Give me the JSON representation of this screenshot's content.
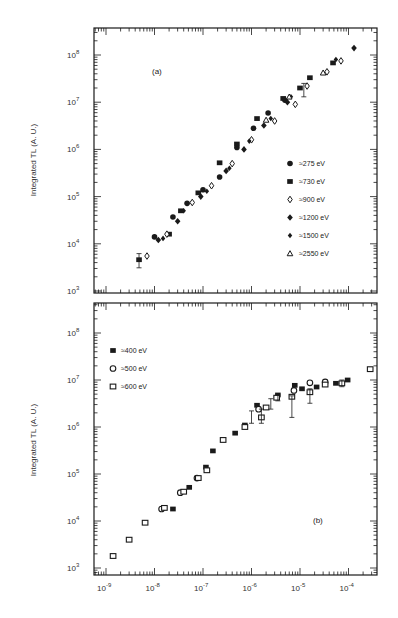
{
  "chart_data": [
    {
      "type": "scatter",
      "panel_label": "(a)",
      "title": "",
      "xlabel": "",
      "ylabel": "Integrated TL (A. U.)",
      "xscale": "log",
      "yscale": "log",
      "xlim": [
        6e-10,
        0.0004
      ],
      "ylim": [
        1000.0,
        300000000.0
      ],
      "x_tick_labels": [
        "10^-9",
        "10^-8",
        "10^-7",
        "10^-6",
        "10^-5",
        "10^-4"
      ],
      "y_tick_labels": [
        "10^3",
        "10^4",
        "10^5",
        "10^6",
        "10^7",
        "10^8"
      ],
      "grid": false,
      "legend_position": "center-right",
      "series": [
        {
          "name": "≈275 eV",
          "marker": "filled-circle",
          "points": [
            [
              1e-08,
              14000.0
            ],
            [
              2.4e-08,
              37000.0
            ],
            [
              4.7e-08,
              72000.0
            ],
            [
              1e-07,
              140000.0
            ],
            [
              2.2e-07,
              260000.0
            ],
            [
              5e-07,
              1100000.0
            ],
            [
              1.1e-06,
              2800000.0
            ],
            [
              2.2e-06,
              5900000.0
            ],
            [
              4.9e-06,
              11000000.0
            ]
          ]
        },
        {
          "name": "≈730 eV",
          "marker": "filled-square",
          "points": [
            [
              4.8e-09,
              4600.0
            ],
            [
              2e-08,
              16000.0
            ],
            [
              3.5e-08,
              50000.0
            ],
            [
              8e-08,
              120000.0
            ],
            [
              2.2e-07,
              520000.0
            ],
            [
              5e-07,
              1300000.0
            ],
            [
              1.3e-06,
              4500000.0
            ],
            [
              4.5e-06,
              12000000.0
            ],
            [
              1e-05,
              20000000.0
            ],
            [
              1.6e-05,
              33000000.0
            ],
            [
              4.8e-05,
              68000000.0
            ]
          ]
        },
        {
          "name": "≈900 eV",
          "marker": "open-diamond",
          "points": [
            [
              7e-09,
              5500.0
            ],
            [
              1.8e-08,
              16000.0
            ],
            [
              6e-08,
              75000.0
            ],
            [
              1.5e-07,
              170000.0
            ],
            [
              4e-07,
              500000.0
            ],
            [
              1e-06,
              1600000.0
            ],
            [
              3e-06,
              4000000.0
            ],
            [
              8e-06,
              9000000.0
            ],
            [
              1.4e-05,
              22000000.0
            ],
            [
              3.6e-05,
              44000000.0
            ],
            [
              7e-05,
              75000000.0
            ]
          ]
        },
        {
          "name": "≈1200 eV",
          "marker": "filled-diamond",
          "points": [
            [
              1.2e-08,
              12000.0
            ],
            [
              3e-08,
              30000.0
            ],
            [
              9e-08,
              100000.0
            ],
            [
              3e-07,
              350000.0
            ],
            [
              7e-07,
              1000000.0
            ],
            [
              1.8e-06,
              3200000.0
            ],
            [
              5.5e-06,
              10000000.0
            ],
            [
              0.00013,
              140000000.0
            ]
          ]
        },
        {
          "name": "≈1500 eV",
          "marker": "filled-diamond-small",
          "points": [
            [
              1.5e-08,
              13000.0
            ],
            [
              4e-08,
              50000.0
            ],
            [
              1.2e-07,
              130000.0
            ],
            [
              3.5e-07,
              400000.0
            ],
            [
              9e-07,
              1500000.0
            ],
            [
              2.5e-06,
              4500000.0
            ],
            [
              6.5e-06,
              13000000.0
            ],
            [
              5.5e-05,
              80000000.0
            ]
          ]
        },
        {
          "name": "≈2550 eV",
          "marker": "open-triangle",
          "points": [
            [
              2e-06,
              4200000.0
            ],
            [
              6e-06,
              13000000.0
            ],
            [
              3e-05,
              42000000.0
            ]
          ]
        }
      ],
      "legend": [
        "≈275 eV",
        "≈730 eV",
        "≈900 eV",
        "≈1200 eV",
        "≈1500 eV",
        "≈2550 eV"
      ]
    },
    {
      "type": "scatter",
      "panel_label": "(b)",
      "title": "",
      "xlabel": "",
      "ylabel": "Integrated TL (A. U.)",
      "xscale": "log",
      "yscale": "log",
      "xlim": [
        6e-10,
        0.0004
      ],
      "ylim": [
        1000.0,
        300000000.0
      ],
      "x_tick_labels": [
        "10^-9",
        "10^-8",
        "10^-7",
        "10^-6",
        "10^-5",
        "10^-4"
      ],
      "y_tick_labels": [
        "10^3",
        "10^4",
        "10^5",
        "10^6",
        "10^7",
        "10^8"
      ],
      "grid": false,
      "legend_position": "upper-left",
      "series": [
        {
          "name": "≈400 eV",
          "marker": "filled-square",
          "points": [
            [
              2.4e-08,
              18000.0
            ],
            [
              5.2e-08,
              52000.0
            ],
            [
              1.15e-07,
              140000.0
            ],
            [
              1.6e-07,
              310000.0
            ],
            [
              4.6e-07,
              740000.0
            ],
            [
              7.3e-07,
              1100000.0
            ],
            [
              1.3e-06,
              2900000.0
            ],
            [
              3.5e-06,
              4800000.0
            ],
            [
              7.8e-06,
              7700000.0
            ],
            [
              1.1e-05,
              6500000.0
            ],
            [
              2.2e-05,
              7100000.0
            ],
            [
              5.5e-05,
              8500000.0
            ],
            [
              9.6e-05,
              10000000.0
            ]
          ]
        },
        {
          "name": "≈500 eV",
          "marker": "open-circle",
          "points": [
            [
              1.4e-08,
              18000.0
            ],
            [
              3.4e-08,
              40000.0
            ],
            [
              7.5e-08,
              82000.0
            ],
            [
              1.4e-06,
              2400000.0
            ],
            [
              7.5e-06,
              6000000.0
            ],
            [
              1.6e-05,
              8700000.0
            ],
            [
              3.3e-05,
              9100000.0
            ]
          ]
        },
        {
          "name": "≈600 eV",
          "marker": "open-square",
          "points": [
            [
              1.4e-09,
              1800.0
            ],
            [
              3e-09,
              4000.0
            ],
            [
              6.4e-09,
              9200.0
            ],
            [
              1.6e-08,
              19000.0
            ],
            [
              4e-08,
              42000.0
            ],
            [
              8e-08,
              82000.0
            ],
            [
              1.2e-07,
              120000.0
            ],
            [
              2.6e-07,
              530000.0
            ],
            [
              7.3e-07,
              1000000.0
            ],
            [
              1.6e-06,
              1600000.0
            ],
            [
              2e-06,
              2600000.0
            ],
            [
              3.3e-06,
              4200000.0
            ],
            [
              6.8e-06,
              4400000.0
            ],
            [
              1.6e-05,
              5500000.0
            ],
            [
              3.3e-05,
              8000000.0
            ],
            [
              7.3e-05,
              8500000.0
            ],
            [
              0.00028,
              17000000.0
            ]
          ]
        }
      ],
      "legend": [
        "≈400 eV",
        "≈500 eV",
        "≈600 eV"
      ]
    }
  ],
  "figure": {
    "panel_a_label": "(a)",
    "panel_b_label": "(b)",
    "ylabel": "Integrated TL (A. U.)",
    "x_ticks": [
      {
        "base": "10",
        "exp": "-9"
      },
      {
        "base": "10",
        "exp": "-8"
      },
      {
        "base": "10",
        "exp": "-7"
      },
      {
        "base": "10",
        "exp": "-6"
      },
      {
        "base": "10",
        "exp": "-5"
      },
      {
        "base": "10",
        "exp": "-4"
      }
    ],
    "y_ticks": [
      {
        "base": "10",
        "exp": "8"
      },
      {
        "base": "10",
        "exp": "7"
      },
      {
        "base": "10",
        "exp": "6"
      },
      {
        "base": "10",
        "exp": "5"
      },
      {
        "base": "10",
        "exp": "4"
      },
      {
        "base": "10",
        "exp": "3"
      }
    ],
    "legend_a": [
      "≈275 eV",
      "≈730 eV",
      "≈900 eV",
      "≈1200 eV",
      "≈1500 eV",
      "≈2550 eV"
    ],
    "legend_b": [
      "≈400 eV",
      "≈500 eV",
      "≈600 eV"
    ],
    "ink_color": "#1a1a1a"
  }
}
